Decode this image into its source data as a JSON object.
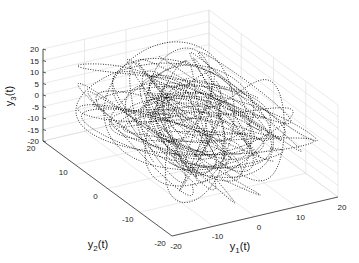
{
  "chart_data": {
    "type": "line",
    "subtype": "3d-dotted-trajectory",
    "title": "",
    "xlabel": "y1(t)",
    "ylabel": "y2(t)",
    "zlabel": "y3(t)",
    "xlim": [
      -20,
      20
    ],
    "ylim": [
      -20,
      20
    ],
    "zlim": [
      -20,
      20
    ],
    "xticks": [
      "-20",
      "-10",
      "0",
      "10",
      "20"
    ],
    "yticks": [
      "-20",
      "-10",
      "0",
      "10",
      "20"
    ],
    "zticks": [
      "-20",
      "-15",
      "-10",
      "-5",
      "0",
      "5",
      "10",
      "15",
      "20"
    ],
    "grid": true,
    "line_style": "dotted",
    "line_color": "#000000"
  },
  "labels": {
    "x": {
      "base": "y",
      "sub": "1",
      "suffix": "(t)"
    },
    "y": {
      "base": "y",
      "sub": "2",
      "suffix": "(t)"
    },
    "z": {
      "base": "y",
      "sub": "3",
      "suffix": "(t)"
    }
  }
}
